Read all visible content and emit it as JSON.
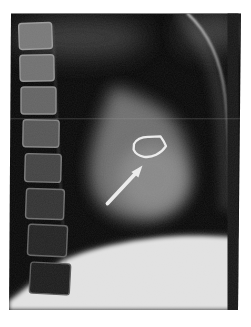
{
  "figure": {
    "alt": "Lateral chest radiograph with a white arrow pointing to a white outlined region over the cardiac silhouette",
    "modality": "chest-radiograph-lateral",
    "annotations": {
      "arrow_color": "#ececec",
      "outline_color": "#ececec",
      "arrow_direction": "pointing-up-right",
      "outline_shape": "curved-quadrilateral"
    },
    "colors": {
      "page_background": "#ffffff",
      "film_black": "#080808",
      "film_edge_strip": "#161616",
      "soft_tissue_gray": "#757575",
      "heart_core_gray": "#8d8d8d",
      "bone_gray": "#787878",
      "haze_gray": "#414141",
      "diaphragm_bright": "#e3e3e3",
      "sternum_line_gray": "#c8c8c8"
    }
  }
}
